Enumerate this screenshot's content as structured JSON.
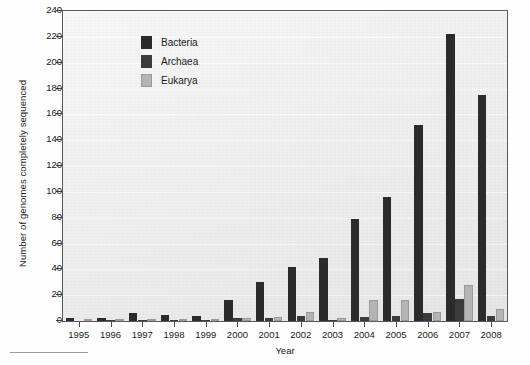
{
  "chart_data": {
    "type": "bar",
    "title": "",
    "xlabel": "Year",
    "ylabel": "Number of genomes completely sequenced",
    "categories": [
      "1995",
      "1996",
      "1997",
      "1998",
      "1999",
      "2000",
      "2001",
      "2002",
      "2003",
      "2004",
      "2005",
      "2006",
      "2007",
      "2008"
    ],
    "series": [
      {
        "name": "Bacteria",
        "color": "#2b2b2b",
        "values": [
          2,
          2,
          6,
          5,
          4,
          16,
          30,
          42,
          49,
          79,
          96,
          152,
          222,
          175
        ]
      },
      {
        "name": "Archaea",
        "color": "#3b3b3b",
        "values": [
          0,
          1,
          1,
          1,
          1,
          2,
          2,
          4,
          1,
          3,
          4,
          6,
          17,
          4
        ]
      },
      {
        "name": "Eukarya",
        "color": "#b4b4b4",
        "values": [
          0,
          0,
          1,
          0,
          0,
          2,
          3,
          7,
          2,
          16,
          16,
          7,
          28,
          9
        ]
      }
    ],
    "ylim": [
      0,
      240
    ],
    "yticks": [
      0,
      20,
      40,
      60,
      80,
      100,
      120,
      140,
      160,
      180,
      200,
      220,
      240
    ],
    "grid": true,
    "legend_position": "top-left"
  },
  "legend": {
    "entries": [
      {
        "label": "Bacteria"
      },
      {
        "label": "Archaea"
      },
      {
        "label": "Eukarya"
      }
    ]
  }
}
